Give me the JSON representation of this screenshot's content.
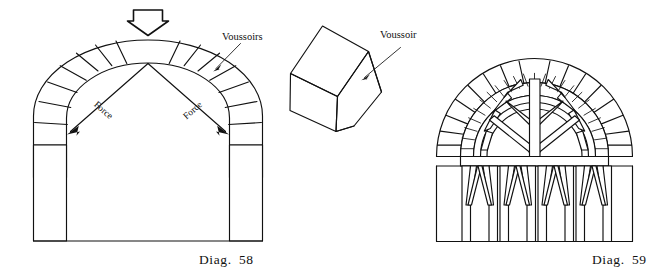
{
  "figure": {
    "background_color": "#ffffff",
    "ink_color": "#111111",
    "width": 672,
    "height": 271
  },
  "diagram_left": {
    "caption_prefix": "Diag.",
    "caption_number": "58",
    "caption_full": "DIAG. 58",
    "subject": "Semicircular stone arch on piers showing voussoirs and thrust forces",
    "load_arrow": {
      "name": "downward-load-arrow",
      "direction": "down",
      "style": "hollow outlined block arrow"
    },
    "force_labels": [
      {
        "text": "Force",
        "side": "left"
      },
      {
        "text": "Force",
        "side": "right"
      }
    ],
    "voussoirs_label": "Voussoirs",
    "voussoir_count": 13,
    "has_pointer_line": true
  },
  "block": {
    "name": "isometric-voussoir-block",
    "label": "Voussoir",
    "texture": "stippled stone",
    "has_pointer_arrow": true
  },
  "diagram_right": {
    "caption_prefix": "Diag.",
    "caption_number": "59",
    "caption_full": "DIAG. 59",
    "subject": "Arch under construction supported on a timber centering and scaffold posts",
    "outer_ring_voussoir_count": 13,
    "inner_ring_voussoir_count": 19,
    "centering_spoke_count": 13,
    "scaffold_post_pairs": 4,
    "texture": "stippled stone"
  }
}
